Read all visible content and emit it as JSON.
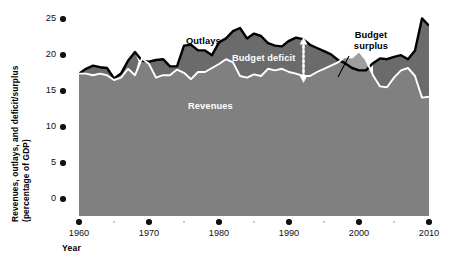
{
  "figure": {
    "background": "#ffffff",
    "axis_label_y_line1": "Revenues, outlays, and deficit/surplus",
    "axis_label_y_line2": "(percentage of GDP)",
    "axis_label_x": "Year"
  },
  "annotations": {
    "outlays": "Outlays",
    "revenues": "Revenues",
    "budget_deficit": "Budget deficit",
    "budget_surplus_line1": "Budget",
    "budget_surplus_line2": "surplus"
  },
  "colors": {
    "revenues_fill": "#808080",
    "deficit_fill": "#6b6b6b",
    "surplus_fill": "#9b9b9b",
    "outlays_line": "#000000",
    "revenues_line": "#ffffff",
    "tick_major": "#111111",
    "tick_minor": "#b9b9b9"
  },
  "chart_data": {
    "type": "area",
    "title": "",
    "xlabel": "Year",
    "ylabel": "Revenues, outlays, and deficit/surplus (percentage of GDP)",
    "xlim": [
      1960,
      2010
    ],
    "ylim": [
      0,
      25
    ],
    "yticks": [
      0,
      5,
      10,
      15,
      20,
      25
    ],
    "xticks": [
      1960,
      1970,
      1980,
      1990,
      2000,
      2010
    ],
    "xticks_minor": [
      1965,
      1975,
      1985,
      1995,
      2005
    ],
    "grid": false,
    "legend": "inline-annotations",
    "x": [
      1960,
      1961,
      1962,
      1963,
      1964,
      1965,
      1966,
      1967,
      1968,
      1969,
      1970,
      1971,
      1972,
      1973,
      1974,
      1975,
      1976,
      1977,
      1978,
      1979,
      1980,
      1981,
      1982,
      1983,
      1984,
      1985,
      1986,
      1987,
      1988,
      1989,
      1990,
      1991,
      1992,
      1993,
      1994,
      1995,
      1996,
      1997,
      1998,
      1999,
      2000,
      2001,
      2002,
      2003,
      2004,
      2005,
      2006,
      2007,
      2008,
      2009,
      2010
    ],
    "series": [
      {
        "name": "Outlays",
        "values": [
          17.8,
          18.4,
          18.8,
          18.6,
          18.5,
          17.2,
          17.8,
          19.4,
          20.5,
          19.4,
          19.3,
          19.5,
          19.6,
          18.7,
          18.7,
          21.3,
          21.4,
          20.7,
          20.7,
          20.1,
          21.7,
          22.2,
          23.1,
          23.5,
          22.2,
          22.8,
          22.5,
          21.6,
          21.3,
          21.2,
          21.9,
          22.3,
          22.1,
          21.4,
          21.0,
          20.6,
          20.2,
          19.5,
          19.1,
          18.5,
          18.2,
          18.2,
          19.1,
          19.7,
          19.6,
          19.9,
          20.1,
          19.6,
          20.7,
          24.7,
          23.8
        ]
      },
      {
        "name": "Revenues",
        "values": [
          17.8,
          17.8,
          17.6,
          17.8,
          17.6,
          17.0,
          17.3,
          18.4,
          17.6,
          19.7,
          19.0,
          17.3,
          17.6,
          17.6,
          18.3,
          17.9,
          17.1,
          18.0,
          18.0,
          18.5,
          19.0,
          19.6,
          19.2,
          17.5,
          17.3,
          17.7,
          17.5,
          18.4,
          18.2,
          18.4,
          18.0,
          17.8,
          17.5,
          17.5,
          18.0,
          18.4,
          18.8,
          19.2,
          19.9,
          19.8,
          20.6,
          19.5,
          17.6,
          16.2,
          16.1,
          17.3,
          18.2,
          18.5,
          17.5,
          14.8,
          14.9
        ]
      }
    ],
    "derived": {
      "budget_deficit_years": "1960-1997 and 2002-2010 (outlays exceed revenues)",
      "budget_surplus_years": "1998-2001 (revenues exceed outlays)"
    }
  }
}
